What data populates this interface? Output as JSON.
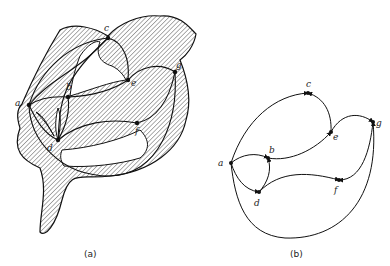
{
  "figure": {
    "panel_a": {
      "caption": "(a)",
      "nodes": [
        {
          "id": "a",
          "label": "a",
          "x": 29,
          "y": 105
        },
        {
          "id": "b",
          "label": "b",
          "x": 68,
          "y": 97
        },
        {
          "id": "c",
          "label": "c",
          "x": 108,
          "y": 38
        },
        {
          "id": "e",
          "label": "e",
          "x": 128,
          "y": 80
        },
        {
          "id": "g",
          "label": "g",
          "x": 175,
          "y": 72
        },
        {
          "id": "f",
          "label": "f",
          "x": 137,
          "y": 123
        },
        {
          "id": "d",
          "label": "d",
          "x": 58,
          "y": 140
        }
      ],
      "description": "Graph embedded on a hatched surface region"
    },
    "panel_b": {
      "caption": "(b)",
      "nodes": [
        {
          "id": "a",
          "label": "a",
          "x": 231,
          "y": 163
        },
        {
          "id": "b",
          "label": "b",
          "x": 268,
          "y": 158
        },
        {
          "id": "c",
          "label": "c",
          "x": 308,
          "y": 93
        },
        {
          "id": "e",
          "label": "e",
          "x": 331,
          "y": 132
        },
        {
          "id": "g",
          "label": "g",
          "x": 373,
          "y": 122
        },
        {
          "id": "f",
          "label": "f",
          "x": 339,
          "y": 180
        },
        {
          "id": "d",
          "label": "d",
          "x": 259,
          "y": 192
        }
      ],
      "edges": [
        [
          "a",
          "c"
        ],
        [
          "e",
          "c"
        ],
        [
          "b",
          "e"
        ],
        [
          "e",
          "g"
        ],
        [
          "a",
          "b"
        ],
        [
          "d",
          "b"
        ],
        [
          "a",
          "d"
        ],
        [
          "d",
          "f"
        ],
        [
          "g",
          "f"
        ],
        [
          "a",
          "g"
        ]
      ]
    }
  }
}
